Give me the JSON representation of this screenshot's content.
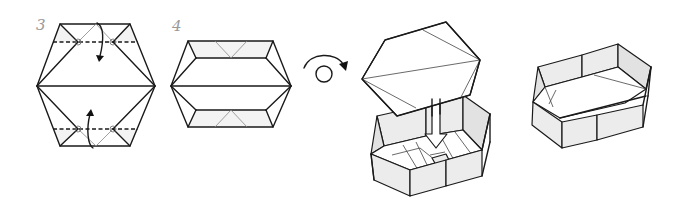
{
  "figure": {
    "type": "origami instruction diagram",
    "steps": [
      {
        "label": "3",
        "description": "Hexagon with top and bottom flaps folded along dashed valley lines, arrows indicating fold direction"
      },
      {
        "label": "4",
        "description": "Hexagon after folds, showing inner rectangle and triangular pockets"
      },
      {
        "label": "",
        "description": "Turn-over symbol (looped arrow)"
      },
      {
        "label": "",
        "description": "Lid being inserted into box base, indicated by downward arrow"
      },
      {
        "label": "",
        "description": "Finished hexagonal box"
      }
    ]
  },
  "colors": {
    "line": "#1a1a1a",
    "shade": "#ececec",
    "label": "#9a9a9a"
  }
}
